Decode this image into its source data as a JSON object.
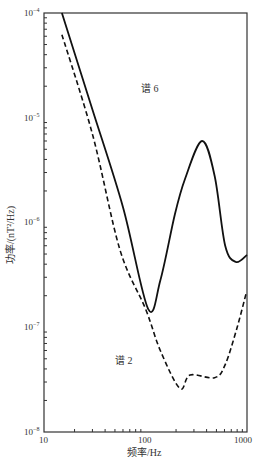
{
  "chart_data": {
    "type": "line",
    "title": "",
    "xlabel": "频率/Hz",
    "ylabel": "功率/(nT²/Hz)",
    "xscale": "log",
    "yscale": "log",
    "xlim": [
      10,
      1000
    ],
    "ylim": [
      1e-08,
      0.0001
    ],
    "x_ticks": [
      "10",
      "100",
      "1000"
    ],
    "y_ticks": [
      "10⁻⁸",
      "10⁻⁷",
      "10⁻⁶",
      "10⁻⁵",
      "10⁻⁴"
    ],
    "grid": false,
    "legend": "inline annotations",
    "series": [
      {
        "name": "谱 6",
        "style": "solid",
        "x": [
          15,
          30,
          60,
          106,
          140,
          195,
          245,
          360,
          480,
          610,
          780,
          1000
        ],
        "y": [
          0.0001,
          1.2e-05,
          1.4e-06,
          1.5e-07,
          2.8e-07,
          1.2e-06,
          2.6e-06,
          6e-06,
          2.8e-06,
          6e-07,
          4.2e-07,
          4.9e-07
        ]
      },
      {
        "name": "谱 2",
        "style": "dashed",
        "x": [
          15,
          30,
          56,
          100,
          140,
          218,
          275,
          480,
          610,
          800,
          980
        ],
        "y": [
          6.2e-05,
          7e-06,
          5.5e-07,
          1.5e-07,
          6e-08,
          2.6e-08,
          3.5e-08,
          3.3e-08,
          4.4e-08,
          1e-07,
          2.1e-07
        ]
      }
    ],
    "annotations": [
      {
        "text": "谱 6",
        "x": 200,
        "y": 1.8e-05
      },
      {
        "text": "谱 2",
        "x": 70,
        "y": 2.8e-08
      }
    ]
  },
  "labels": {
    "xlabel": "频率/Hz",
    "ylabel": "功率/(nT²/Hz)",
    "series6": "谱 6",
    "series2": "谱 2",
    "x10": "10",
    "x100": "100",
    "x1000": "1000"
  }
}
